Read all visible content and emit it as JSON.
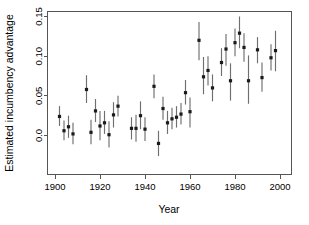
{
  "chart_data": {
    "type": "scatter",
    "title": "",
    "xlabel": "Year",
    "ylabel": "Estimated incumbency advantage",
    "xlim": [
      1896,
      2002
    ],
    "ylim": [
      -0.035,
      0.158
    ],
    "grid": false,
    "legend": null,
    "xticks": [
      1900,
      1920,
      1940,
      1960,
      1980,
      2000
    ],
    "xtick_labels": [
      "1900",
      "1920",
      "1940",
      "1960",
      "1980",
      "2000"
    ],
    "yticks": [
      0.0,
      0.05,
      0.1,
      0.15
    ],
    "ytick_labels": [
      "0.0",
      "0.05",
      "0.10",
      "0.15"
    ],
    "error_bars": "vertical confidence intervals",
    "x": [
      1902,
      1904,
      1906,
      1908,
      1910,
      1914,
      1916,
      1918,
      1920,
      1922,
      1924,
      1926,
      1928,
      1930,
      1934,
      1936,
      1938,
      1940,
      1944,
      1946,
      1948,
      1950,
      1952,
      1954,
      1956,
      1958,
      1960,
      1964,
      1966,
      1968,
      1970,
      1974,
      1976,
      1978,
      1980,
      1982,
      1984,
      1986,
      1988,
      1990,
      1994,
      1996,
      1998,
      2000
    ],
    "values": [
      0.024,
      0.006,
      0.011,
      0.002,
      0.058,
      0.004,
      0.031,
      0.012,
      0.016,
      0.001,
      0.026,
      0.037,
      0.009,
      0.009,
      0.025,
      0.008,
      0.062,
      -0.01,
      0.034,
      0.016,
      0.021,
      0.023,
      0.027,
      0.054,
      0.03,
      0.12,
      0.074,
      0.082,
      0.06,
      0.092,
      0.109,
      0.069,
      0.117,
      0.129,
      0.111,
      0.069,
      0.108,
      0.073,
      0.098,
      0.107,
      0.026,
      0.037,
      0.009,
      0.009
    ],
    "series": [
      {
        "name": "Estimated incumbency advantage",
        "points": [
          {
            "year": 1902,
            "value": 0.024,
            "low": 0.012,
            "high": 0.037
          },
          {
            "year": 1904,
            "value": 0.006,
            "low": -0.006,
            "high": 0.019
          },
          {
            "year": 1906,
            "value": 0.011,
            "low": -0.003,
            "high": 0.025
          },
          {
            "year": 1908,
            "value": 0.002,
            "low": -0.011,
            "high": 0.016
          },
          {
            "year": 1914,
            "value": 0.058,
            "low": 0.041,
            "high": 0.076
          },
          {
            "year": 1916,
            "value": 0.004,
            "low": -0.011,
            "high": 0.02
          },
          {
            "year": 1918,
            "value": 0.031,
            "low": 0.017,
            "high": 0.046
          },
          {
            "year": 1920,
            "value": 0.012,
            "low": -0.006,
            "high": 0.031
          },
          {
            "year": 1922,
            "value": 0.016,
            "low": 0.002,
            "high": 0.031
          },
          {
            "year": 1924,
            "value": 0.001,
            "low": -0.015,
            "high": 0.018
          },
          {
            "year": 1926,
            "value": 0.026,
            "low": 0.01,
            "high": 0.042
          },
          {
            "year": 1928,
            "value": 0.037,
            "low": 0.024,
            "high": 0.05
          },
          {
            "year": 1934,
            "value": 0.009,
            "low": -0.005,
            "high": 0.023
          },
          {
            "year": 1936,
            "value": 0.009,
            "low": -0.008,
            "high": 0.026
          },
          {
            "year": 1938,
            "value": 0.025,
            "low": 0.008,
            "high": 0.043
          },
          {
            "year": 1940,
            "value": 0.008,
            "low": -0.007,
            "high": 0.023
          },
          {
            "year": 1944,
            "value": 0.062,
            "low": 0.047,
            "high": 0.077
          },
          {
            "year": 1946,
            "value": -0.01,
            "low": -0.026,
            "high": 0.006
          },
          {
            "year": 1948,
            "value": 0.034,
            "low": 0.02,
            "high": 0.049
          },
          {
            "year": 1950,
            "value": 0.016,
            "low": 0.002,
            "high": 0.031
          },
          {
            "year": 1952,
            "value": 0.021,
            "low": 0.008,
            "high": 0.035
          },
          {
            "year": 1954,
            "value": 0.023,
            "low": 0.01,
            "high": 0.037
          },
          {
            "year": 1956,
            "value": 0.027,
            "low": 0.014,
            "high": 0.041
          },
          {
            "year": 1958,
            "value": 0.054,
            "low": 0.039,
            "high": 0.07
          },
          {
            "year": 1960,
            "value": 0.03,
            "low": 0.01,
            "high": 0.048
          },
          {
            "year": 1964,
            "value": 0.12,
            "low": 0.095,
            "high": 0.143
          },
          {
            "year": 1966,
            "value": 0.074,
            "low": 0.052,
            "high": 0.099
          },
          {
            "year": 1968,
            "value": 0.082,
            "low": 0.063,
            "high": 0.1
          },
          {
            "year": 1970,
            "value": 0.06,
            "low": 0.043,
            "high": 0.077
          },
          {
            "year": 1974,
            "value": 0.092,
            "low": 0.075,
            "high": 0.11
          },
          {
            "year": 1976,
            "value": 0.109,
            "low": 0.088,
            "high": 0.128
          },
          {
            "year": 1978,
            "value": 0.069,
            "low": 0.044,
            "high": 0.091
          },
          {
            "year": 1980,
            "value": 0.117,
            "low": 0.1,
            "high": 0.135
          },
          {
            "year": 1982,
            "value": 0.129,
            "low": 0.11,
            "high": 0.15
          },
          {
            "year": 1984,
            "value": 0.111,
            "low": 0.093,
            "high": 0.129
          },
          {
            "year": 1986,
            "value": 0.069,
            "low": 0.04,
            "high": 0.101
          },
          {
            "year": 1990,
            "value": 0.108,
            "low": 0.091,
            "high": 0.124
          },
          {
            "year": 1992,
            "value": 0.073,
            "low": 0.055,
            "high": 0.092
          },
          {
            "year": 1996,
            "value": 0.098,
            "low": 0.082,
            "high": 0.115
          },
          {
            "year": 1998,
            "value": 0.107,
            "low": 0.081,
            "high": 0.132
          }
        ]
      }
    ]
  },
  "axes": {
    "x_title": "Year",
    "y_title": "Estimated incumbency advantage",
    "x_tick_labels": [
      "1900",
      "1920",
      "1940",
      "1960",
      "1980",
      "2000"
    ],
    "y_tick_labels": [
      "0.0",
      "0.05",
      "0.10",
      "0.15"
    ]
  },
  "colors": {
    "point": "#1a1a1a",
    "errorbar": "#6f6f6f",
    "axis": "#555555",
    "background": "#ffffff",
    "text": "#000000"
  }
}
